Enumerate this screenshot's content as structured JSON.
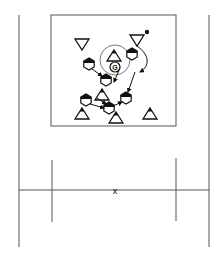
{
  "diagram": {
    "type": "sports-drill",
    "colors": {
      "line": "#555555",
      "ink": "#111111",
      "background": "#ffffff"
    },
    "field": {
      "outer_left_x": 19,
      "outer_right_x": 209,
      "top_y": 15,
      "bottom_y": 247,
      "box": {
        "x1": 51,
        "y1": 15,
        "x2": 176,
        "y2": 126
      },
      "center_line_y": 190,
      "ticks": [
        {
          "x": 52,
          "y1": 160,
          "y2": 222
        },
        {
          "x": 176,
          "y1": 158,
          "y2": 221
        }
      ],
      "center_mark": {
        "x": 115,
        "y": 191,
        "label": "x"
      }
    },
    "goalkeeper": {
      "x": 115,
      "y": 62,
      "label": "G",
      "circle_r": 15
    },
    "ball": {
      "x": 147,
      "y": 32
    },
    "cones_down": [
      {
        "x": 82,
        "y": 44
      },
      {
        "x": 137,
        "y": 40
      }
    ],
    "cones_up": [
      {
        "x": 82,
        "y": 114
      },
      {
        "x": 116,
        "y": 118
      },
      {
        "x": 150,
        "y": 114
      },
      {
        "x": 102,
        "y": 95
      },
      {
        "x": 114,
        "y": 56
      }
    ],
    "players": [
      {
        "x": 89,
        "y": 64
      },
      {
        "x": 132,
        "y": 54
      },
      {
        "x": 106,
        "y": 80
      },
      {
        "x": 86,
        "y": 100
      },
      {
        "x": 109,
        "y": 108
      },
      {
        "x": 126,
        "y": 98
      }
    ],
    "arrows": [
      {
        "from": [
          92,
          69
        ],
        "to": [
          102,
          76
        ]
      },
      {
        "from": [
          120,
          68
        ],
        "to": [
          114,
          82
        ]
      },
      {
        "from": [
          135,
          72
        ],
        "to": [
          128,
          92
        ]
      },
      {
        "from": [
          90,
          104
        ],
        "to": [
          104,
          108
        ]
      },
      {
        "from": [
          97,
          98
        ],
        "to": [
          106,
          104
        ]
      },
      {
        "from": [
          113,
          106
        ],
        "to": [
          122,
          102
        ]
      }
    ]
  }
}
